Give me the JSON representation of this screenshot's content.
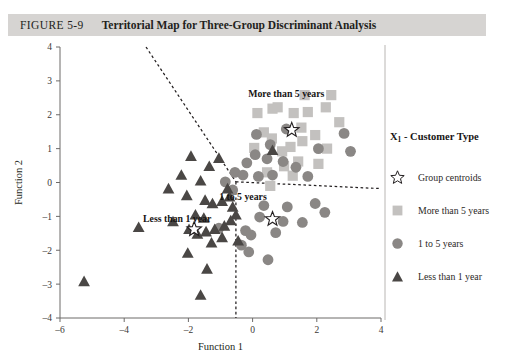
{
  "figure": {
    "number": "FIGURE 5-9",
    "title": "Territorial Map for Three-Group Discriminant Analysis"
  },
  "legend": {
    "title_prefix": "X",
    "title_subscript": "1",
    "title_suffix": " - Customer Type",
    "items": [
      {
        "label": "Group centroids",
        "marker": "star-outline-icon",
        "color": "#ffffff"
      },
      {
        "label": "More than 5 years",
        "marker": "square-marker-icon",
        "color": "#c3c1bf"
      },
      {
        "label": "1 to 5 years",
        "marker": "circle-marker-icon",
        "color": "#8a8785"
      },
      {
        "label": "Less than 1 year",
        "marker": "triangle-marker-icon",
        "color": "#4a4745"
      }
    ]
  },
  "annotations": [
    {
      "text": "More than 5 years",
      "x": 1.05,
      "y": 2.52
    },
    {
      "text": "1 to 5 years",
      "x": -0.3,
      "y": -0.52
    },
    {
      "text": "Less than 1 year",
      "x": -2.35,
      "y": -1.18
    }
  ],
  "chart_data": {
    "type": "scatter",
    "title": "Territorial Map for Three-Group Discriminant Analysis",
    "xlabel": "Function 1",
    "ylabel": "Function 2",
    "xlim": [
      -6,
      4
    ],
    "ylim": [
      -4,
      4
    ],
    "xticks": [
      -6,
      -4,
      -2,
      0,
      2,
      4
    ],
    "yticks": [
      -4,
      -3,
      -2,
      -1,
      0,
      1,
      2,
      3,
      4
    ],
    "xtick_labels": [
      "-6",
      "-4",
      "-2",
      "0",
      "2",
      "4"
    ],
    "ytick_labels": [
      "-4",
      "-3",
      "-2",
      "-1",
      "0",
      "1",
      "2",
      "3",
      "4"
    ],
    "grid": false,
    "legend_position": "right",
    "series": [
      {
        "name": "More than 5 years",
        "marker": "square",
        "color": "#c3c1bf",
        "points": [
          [
            0.15,
            2.05
          ],
          [
            0.62,
            2.18
          ],
          [
            0.78,
            2.22
          ],
          [
            1.28,
            2.05
          ],
          [
            1.72,
            2.08
          ],
          [
            2.28,
            2.22
          ],
          [
            2.7,
            1.78
          ],
          [
            0.35,
            1.48
          ],
          [
            0.6,
            1.3
          ],
          [
            1.52,
            1.62
          ],
          [
            1.55,
            1.22
          ],
          [
            1.95,
            1.4
          ],
          [
            1.18,
            1.05
          ],
          [
            2.32,
            1.0
          ],
          [
            0.05,
            1.02
          ],
          [
            1.42,
            0.62
          ],
          [
            0.98,
            0.48
          ],
          [
            2.05,
            0.55
          ],
          [
            0.45,
            0.3
          ],
          [
            1.25,
            0.2
          ],
          [
            0.55,
            -0.1
          ],
          [
            1.62,
            2.58
          ],
          [
            2.45,
            2.58
          ],
          [
            0.92,
            0.92
          ]
        ]
      },
      {
        "name": "1 to 5 years",
        "marker": "circle",
        "color": "#8a8785",
        "points": [
          [
            1.05,
            1.58
          ],
          [
            2.05,
            1.0
          ],
          [
            3.05,
            0.92
          ],
          [
            0.55,
            1.12
          ],
          [
            0.08,
            0.82
          ],
          [
            0.45,
            0.7
          ],
          [
            -0.18,
            0.58
          ],
          [
            0.95,
            0.62
          ],
          [
            1.35,
            0.45
          ],
          [
            -0.55,
            0.3
          ],
          [
            -0.3,
            0.22
          ],
          [
            0.18,
            0.18
          ],
          [
            0.62,
            0.22
          ],
          [
            -0.85,
            0.02
          ],
          [
            -0.62,
            -0.22
          ],
          [
            0.35,
            -0.68
          ],
          [
            1.08,
            -0.72
          ],
          [
            1.95,
            -0.62
          ],
          [
            0.22,
            -1.02
          ],
          [
            0.95,
            -1.15
          ],
          [
            1.55,
            -1.18
          ],
          [
            -0.22,
            -1.42
          ],
          [
            -0.05,
            -1.55
          ],
          [
            0.72,
            -1.48
          ],
          [
            -0.35,
            -1.85
          ],
          [
            -0.12,
            -2.05
          ],
          [
            0.48,
            -2.28
          ],
          [
            2.25,
            -0.88
          ],
          [
            1.72,
            0.18
          ],
          [
            -1.05,
            -1.35
          ],
          [
            2.85,
            1.45
          ],
          [
            0.12,
            1.42
          ]
        ]
      },
      {
        "name": "Less than 1 year",
        "marker": "triangle",
        "color": "#4a4745",
        "points": [
          [
            -1.92,
            0.78
          ],
          [
            -2.22,
            0.22
          ],
          [
            -1.62,
            0.05
          ],
          [
            -1.35,
            0.48
          ],
          [
            -1.05,
            0.72
          ],
          [
            -2.62,
            -0.18
          ],
          [
            -2.05,
            -0.38
          ],
          [
            -1.48,
            -0.52
          ],
          [
            -1.25,
            -0.62
          ],
          [
            -0.95,
            -0.55
          ],
          [
            -0.72,
            -0.42
          ],
          [
            -0.62,
            -0.72
          ],
          [
            -1.78,
            -0.95
          ],
          [
            -1.52,
            -1.05
          ],
          [
            -2.48,
            -1.15
          ],
          [
            -3.55,
            -1.32
          ],
          [
            -1.98,
            -1.38
          ],
          [
            -1.72,
            -1.52
          ],
          [
            -1.45,
            -1.45
          ],
          [
            -1.18,
            -1.38
          ],
          [
            -0.88,
            -1.28
          ],
          [
            -0.95,
            -1.62
          ],
          [
            -1.28,
            -1.78
          ],
          [
            -2.02,
            -2.08
          ],
          [
            -1.42,
            -2.55
          ],
          [
            -1.62,
            -3.32
          ],
          [
            -5.25,
            -2.92
          ],
          [
            -0.52,
            -0.95
          ],
          [
            0.62,
            0.95
          ],
          [
            -0.68,
            -1.12
          ],
          [
            -0.45,
            -1.72
          ],
          [
            -0.78,
            -0.18
          ]
        ]
      },
      {
        "name": "Group centroids",
        "marker": "star",
        "color": "#ffffff",
        "points": [
          [
            1.22,
            1.55
          ],
          [
            0.62,
            -1.08
          ],
          [
            -1.82,
            -1.38
          ]
        ]
      }
    ],
    "boundaries": [
      {
        "name": "upper-left-boundary",
        "from": [
          -3.32,
          4.0
        ],
        "to": [
          -0.52,
          0.02
        ]
      },
      {
        "name": "right-boundary",
        "from": [
          -0.52,
          0.02
        ],
        "to": [
          4.0,
          -0.18
        ]
      },
      {
        "name": "lower-boundary",
        "from": [
          -0.52,
          0.02
        ],
        "to": [
          -0.52,
          -4.0
        ]
      }
    ]
  }
}
